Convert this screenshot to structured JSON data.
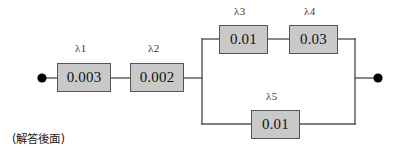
{
  "diagram": {
    "type": "reliability-block-diagram",
    "caption": "(解答後面)",
    "colors": {
      "block_fill": "#c9c9c9",
      "block_border": "#555555",
      "wire": "#555555",
      "terminal": "#000000",
      "background": "#ffffff"
    },
    "terminals": [
      {
        "name": "input-terminal",
        "x": 42,
        "y": 78
      },
      {
        "name": "output-terminal",
        "x": 378,
        "y": 78
      }
    ],
    "blocks": [
      {
        "id": "lambda1",
        "label": "λ1",
        "value": "0.003",
        "x": 57,
        "y": 63,
        "w": 54,
        "h": 29
      },
      {
        "id": "lambda2",
        "label": "λ2",
        "value": "0.002",
        "x": 130,
        "y": 63,
        "w": 54,
        "h": 29
      },
      {
        "id": "lambda3",
        "label": "λ3",
        "value": "0.01",
        "x": 219,
        "y": 25,
        "w": 49,
        "h": 29
      },
      {
        "id": "lambda4",
        "label": "λ4",
        "value": "0.03",
        "x": 289,
        "y": 25,
        "w": 49,
        "h": 29
      },
      {
        "id": "lambda5",
        "label": "λ5",
        "value": "0.01",
        "x": 251,
        "y": 110,
        "w": 49,
        "h": 29
      }
    ],
    "label_positions": [
      {
        "id": "lambda1-label",
        "x": 75,
        "y": 44
      },
      {
        "id": "lambda2-label",
        "x": 148,
        "y": 44
      },
      {
        "id": "lambda3-label",
        "x": 234,
        "y": 7
      },
      {
        "id": "lambda4-label",
        "x": 304,
        "y": 7
      },
      {
        "id": "lambda5-label",
        "x": 266,
        "y": 92
      }
    ],
    "caption_position": {
      "x": 12,
      "y": 130
    },
    "topology": {
      "series_head": [
        "lambda1",
        "lambda2"
      ],
      "parallel_branches": [
        [
          "lambda3",
          "lambda4"
        ],
        [
          "lambda5"
        ]
      ],
      "split_x": 202,
      "join_x": 355,
      "top_branch_y": 39,
      "bottom_branch_y": 124,
      "main_y": 78
    }
  }
}
